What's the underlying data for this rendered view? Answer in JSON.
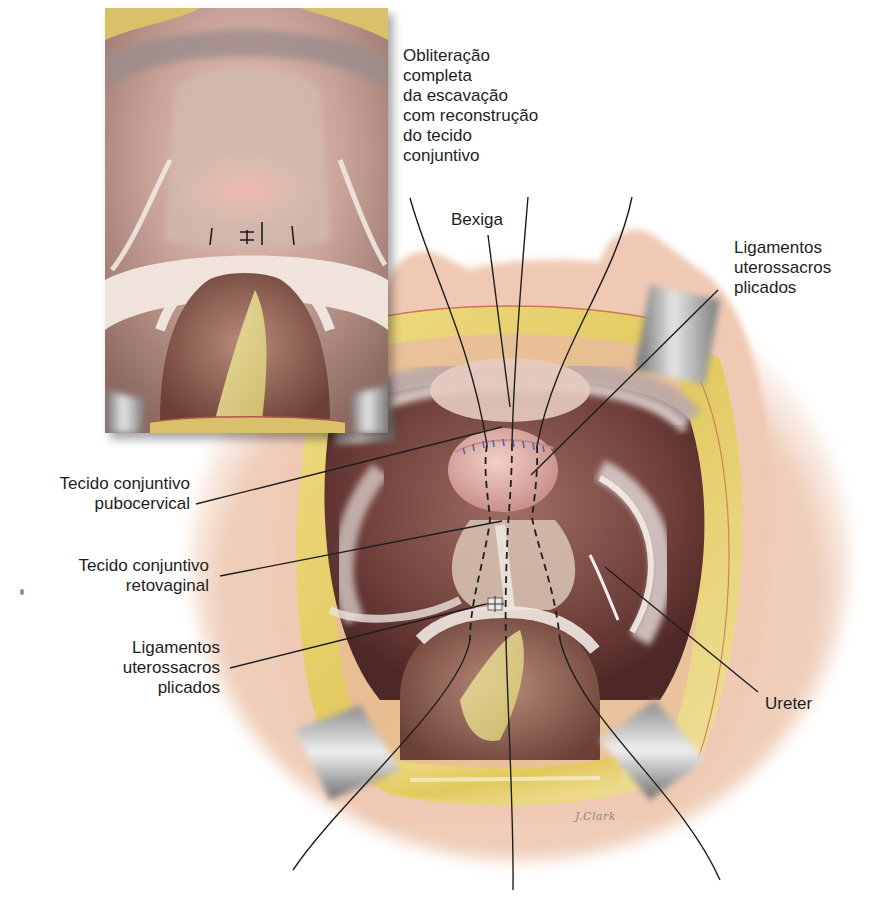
{
  "figure": {
    "artist_signature": "J.Clark",
    "colors": {
      "background": "#ffffff",
      "fat_yellow": "#e6cf6a",
      "tissue_pink": "#e7b9ae",
      "bladder_pink": "#deaaa6",
      "cavity_dark": "#7a4a44",
      "retractor_gray": "#9a9a9a",
      "suture_blue": "#5566aa",
      "leader_line": "#1e1e1e",
      "label_text": "#1e1e1e"
    },
    "inset": {
      "description": "Vista em detalhe: escavação obliterada com sutura",
      "position": {
        "x": 105,
        "y": 8,
        "width": 283,
        "height": 425
      }
    }
  },
  "labels": {
    "obliteration": {
      "lines": [
        "Obliteração",
        "completa",
        "da escavação",
        "com reconstrução",
        "do tecido",
        "conjuntivo"
      ]
    },
    "bladder": {
      "lines": [
        "Bexiga"
      ]
    },
    "uterosacral_top": {
      "lines": [
        "Ligamentos",
        "uterossacros",
        "plicados"
      ]
    },
    "pubocervical": {
      "lines": [
        "Tecido conjuntivo",
        "pubocervical"
      ]
    },
    "rectovaginal": {
      "lines": [
        "Tecido conjuntivo",
        "retovaginal"
      ]
    },
    "uterosacral_left": {
      "lines": [
        "Ligamentos",
        "uterossacros",
        "plicados"
      ]
    },
    "ureter": {
      "lines": [
        "Ureter"
      ]
    }
  }
}
